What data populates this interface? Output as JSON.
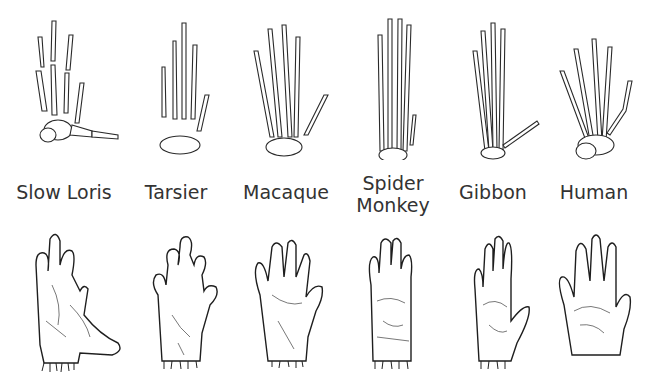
{
  "rows": [
    "skeleton",
    "hand"
  ],
  "species": [
    {
      "id": "slow-loris",
      "label": "Slow Loris",
      "x": 14
    },
    {
      "id": "tarsier",
      "label": "Tarsier",
      "x": 120
    },
    {
      "id": "macaque",
      "label": "Macaque",
      "x": 228
    },
    {
      "id": "spider-monkey",
      "label": "Spider Monkey",
      "label_line1": "Spider",
      "label_line2": "Monkey",
      "x": 335
    },
    {
      "id": "gibbon",
      "label": "Gibbon",
      "x": 443
    },
    {
      "id": "human",
      "label": "Human",
      "x": 550
    }
  ],
  "colors": {
    "background": "#ffffff",
    "ink": "#222222",
    "label": "#333333"
  }
}
